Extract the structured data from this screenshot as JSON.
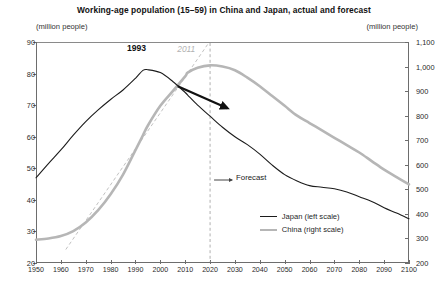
{
  "chart_data": {
    "type": "line",
    "title": "Working-age population (15–59) in China and Japan, actual and forecast",
    "xlabel": "",
    "ylabel_left": "(million people)",
    "ylabel_right": "(million people)",
    "ylim_left": [
      20,
      90
    ],
    "ylim_right": [
      200,
      1100
    ],
    "xlim": [
      1950,
      2100
    ],
    "grid": false,
    "legend_position": "inside-bottom-right",
    "yticks_left": [
      "90",
      "80",
      "70",
      "60",
      "50",
      "40",
      "30",
      "20"
    ],
    "yticks_right": [
      "1,100",
      "1,000",
      "900",
      "800",
      "700",
      "600",
      "500",
      "400",
      "300",
      "200"
    ],
    "xticks": [
      "1950",
      "1960",
      "1970",
      "1980",
      "1990",
      "2000",
      "2010",
      "2020",
      "2030",
      "2040",
      "2050",
      "2060",
      "2070",
      "2080",
      "2090",
      "2100"
    ],
    "x": [
      1950,
      1955,
      1960,
      1965,
      1970,
      1975,
      1980,
      1985,
      1990,
      1993,
      1995,
      2000,
      2005,
      2010,
      2011,
      2015,
      2020,
      2025,
      2030,
      2035,
      2040,
      2045,
      2050,
      2055,
      2060,
      2065,
      2070,
      2075,
      2080,
      2085,
      2090,
      2095,
      2100
    ],
    "series": [
      {
        "name": "Japan (left scale)",
        "scale": "left",
        "color": "#1c1c1c",
        "width": 1.1,
        "values": [
          47.0,
          51.5,
          55.8,
          60.5,
          64.8,
          68.5,
          71.8,
          74.8,
          78.5,
          81.0,
          81.2,
          80.3,
          77.5,
          74.0,
          73.2,
          70.0,
          66.5,
          63.0,
          60.0,
          57.5,
          54.5,
          51.0,
          48.0,
          46.0,
          44.5,
          44.0,
          43.5,
          42.5,
          41.0,
          39.5,
          37.5,
          35.8,
          34.0
        ]
      },
      {
        "name": "China (right scale)",
        "scale": "right",
        "color": "#b6b6b6",
        "width": 2.6,
        "values": [
          295,
          300,
          310,
          330,
          365,
          415,
          480,
          560,
          660,
          720,
          760,
          840,
          900,
          960,
          975,
          995,
          1005,
          1000,
          985,
          955,
          920,
          880,
          840,
          800,
          770,
          740,
          710,
          680,
          650,
          615,
          580,
          550,
          520
        ]
      }
    ],
    "annotations": [
      {
        "name": "japan-peak-year",
        "text": "1993",
        "style": "bold-black"
      },
      {
        "name": "china-trend-year",
        "text": "2011",
        "style": "gray-italic"
      },
      {
        "name": "forecast-label",
        "text": "Forecast",
        "style": "plain"
      },
      {
        "name": "forecast-divider",
        "text": "",
        "value": 2020,
        "style": "dashed-vertical"
      },
      {
        "name": "china-trend-guide",
        "text": "",
        "style": "dashed-diagonal-gray"
      },
      {
        "name": "decline-arrow",
        "text": "",
        "style": "black-arrow"
      }
    ]
  }
}
